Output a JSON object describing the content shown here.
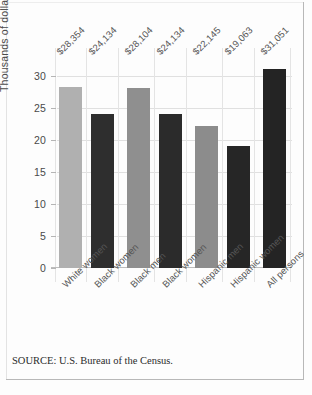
{
  "chart_data": {
    "type": "bar",
    "title": "",
    "subtitle": "",
    "xlabel": "",
    "ylabel": "Thousands of dollars",
    "ylim": [
      0,
      32.5
    ],
    "yticks": [
      0,
      5,
      10,
      15,
      20,
      25,
      30
    ],
    "ytick_labels": [
      "0",
      "5",
      "10",
      "15",
      "20",
      "25",
      "30"
    ],
    "grid": true,
    "legend": "none",
    "value_label_format": "$#,###",
    "categories": [
      "White women",
      "Black women",
      "Black men",
      "Black women",
      "Hispanic men",
      "Hispanic women",
      "All persons"
    ],
    "values": [
      28.354,
      24.134,
      28.104,
      24.134,
      22.145,
      19.063,
      31.051
    ],
    "value_labels": [
      "$28,354",
      "$24,134",
      "$28,104",
      "$24,134",
      "$22,145",
      "$19,063",
      "$31,051"
    ],
    "bar_colors": [
      "#b0b0b0",
      "#2e2e2e",
      "#8f8f8f",
      "#2b2b2b",
      "#8c8c8c",
      "#262626",
      "#242424"
    ],
    "bars": [
      {
        "category": "White women",
        "value": 28.354,
        "label": "$28,354",
        "color": "#b0b0b0",
        "shade": "light"
      },
      {
        "category": "Black women",
        "value": 24.134,
        "label": "$24,134",
        "color": "#2e2e2e",
        "shade": "dark"
      },
      {
        "category": "Black men",
        "value": 28.104,
        "label": "$28,104",
        "color": "#8f8f8f",
        "shade": "light"
      },
      {
        "category": "Black women",
        "value": 24.134,
        "label": "$24,134",
        "color": "#2b2b2b",
        "shade": "dark"
      },
      {
        "category": "Hispanic men",
        "value": 22.145,
        "label": "$22,145",
        "color": "#8c8c8c",
        "shade": "light"
      },
      {
        "category": "Hispanic women",
        "value": 19.063,
        "label": "$19,063",
        "color": "#262626",
        "shade": "dark"
      },
      {
        "category": "All persons",
        "value": 31.051,
        "label": "$31,051",
        "color": "#242424",
        "shade": "dark"
      }
    ]
  },
  "footer": {
    "source": "SOURCE: U.S. Bureau of the Census."
  }
}
